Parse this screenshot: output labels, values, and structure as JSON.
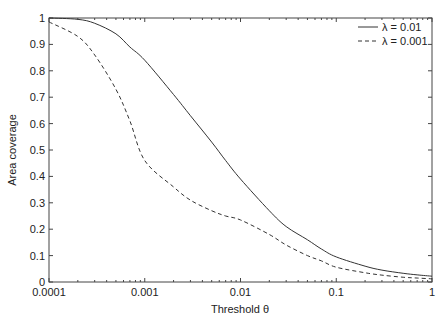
{
  "chart_data": {
    "type": "line",
    "title": "",
    "xlabel": "Threshold θ",
    "ylabel": "Area coverage",
    "xscale": "log",
    "xlim": [
      0.0001,
      1
    ],
    "ylim": [
      0,
      1
    ],
    "xticks": [
      "0.0001",
      "0.001",
      "0.01",
      "0.1",
      "1"
    ],
    "yticks": [
      "0",
      "0.1",
      "0.2",
      "0.3",
      "0.4",
      "0.5",
      "0.6",
      "0.7",
      "0.8",
      "0.9",
      "1"
    ],
    "grid": false,
    "legend_position": "upper right",
    "x": [
      0.0001,
      0.0002,
      0.0003,
      0.0005,
      0.0007,
      0.001,
      0.002,
      0.003,
      0.005,
      0.007,
      0.01,
      0.02,
      0.03,
      0.05,
      0.07,
      0.1,
      0.2,
      0.3,
      0.5,
      0.7,
      1
    ],
    "series": [
      {
        "name": "λ = 0.01",
        "style": "solid",
        "values": [
          1.0,
          0.995,
          0.98,
          0.94,
          0.89,
          0.84,
          0.71,
          0.63,
          0.53,
          0.46,
          0.39,
          0.27,
          0.21,
          0.16,
          0.125,
          0.095,
          0.06,
          0.045,
          0.033,
          0.027,
          0.022
        ]
      },
      {
        "name": "λ = 0.001",
        "style": "dashed",
        "values": [
          0.985,
          0.93,
          0.86,
          0.73,
          0.61,
          0.46,
          0.36,
          0.31,
          0.27,
          0.25,
          0.235,
          0.18,
          0.14,
          0.1,
          0.08,
          0.056,
          0.035,
          0.026,
          0.018,
          0.015,
          0.012
        ]
      }
    ]
  }
}
